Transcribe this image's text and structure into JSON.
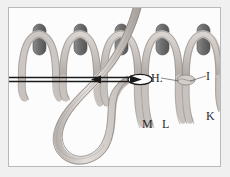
{
  "figure": {
    "background_color": "#f0f0f0",
    "panel_color": "#fcfcfc",
    "border_color": "#b9b9b9",
    "yarn_fill": "#cfc9c6",
    "yarn_stroke": "#8a8582",
    "peg_fill": "#7e7e7e",
    "peg_stroke": "#5b5b5b",
    "needle_color": "#1a1a1a",
    "label_color": "#2b2b2b"
  },
  "labels": [
    {
      "id": "H",
      "text": "H.",
      "x": 150,
      "y": 71,
      "leader": true
    },
    {
      "id": "I",
      "text": "I",
      "x": 205,
      "y": 70,
      "leader": true
    },
    {
      "id": "M",
      "text": "M",
      "x": 141,
      "y": 118,
      "leader": false
    },
    {
      "id": "L",
      "text": "L",
      "x": 161,
      "y": 118,
      "leader": false
    },
    {
      "id": "K",
      "text": "K",
      "x": 205,
      "y": 110,
      "leader": false
    }
  ],
  "pegs": [
    {
      "index": 1,
      "x": 30
    },
    {
      "index": 2,
      "x": 71
    },
    {
      "index": 3,
      "x": 112
    },
    {
      "index": 4,
      "x": 153
    },
    {
      "index": 5,
      "x": 194
    }
  ],
  "needle": {
    "label": "threaded-needle",
    "y": 71,
    "x_start": 4,
    "x_end": 140,
    "arrow_count": 2,
    "arrow_x": [
      90,
      125
    ]
  },
  "yarn_tail": {
    "label": "hanging-yarn-loop",
    "description": "Large pendant loop of yarn descending from the working strand"
  }
}
